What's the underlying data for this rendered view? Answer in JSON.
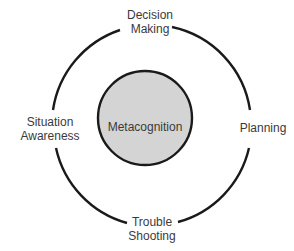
{
  "diagram": {
    "center": {
      "label": "Metacognition",
      "fill": "#d4d4d4",
      "stroke": "#1a1a1a"
    },
    "nodes": [
      {
        "id": "top",
        "line1": "Decision",
        "line2": "Making"
      },
      {
        "id": "right",
        "line1": "Planning",
        "line2": ""
      },
      {
        "id": "bottom",
        "line1": "Trouble",
        "line2": "Shooting"
      },
      {
        "id": "left",
        "line1": "Situation",
        "line2": "Awareness"
      }
    ],
    "ring_color": "#1a1a1a"
  }
}
